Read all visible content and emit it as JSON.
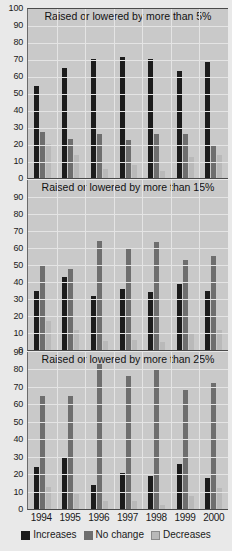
{
  "chart_data": {
    "type": "bar",
    "title": "",
    "xlabel": "",
    "ylabel": "",
    "grid": true,
    "legend_position": "bottom",
    "categories": [
      "1994",
      "1995",
      "1996",
      "1997",
      "1998",
      "1999",
      "2000"
    ],
    "legend": [
      "Increases",
      "No change",
      "Decreases"
    ],
    "colors": {
      "increases": "#1c1c1c",
      "no_change": "#6e6e6e",
      "decreases": "#b9b9b9",
      "plot_background": "#c9c9c9",
      "page_background": "#e9e9e9",
      "gridline": "#e4e4e4"
    },
    "panels": [
      {
        "title": "Raised or lowered by more than 5%",
        "ylim": [
          0,
          100
        ],
        "yticks": [
          0,
          10,
          20,
          30,
          40,
          50,
          60,
          70,
          80,
          90,
          100
        ],
        "series": [
          {
            "name": "Increases",
            "values": [
              54,
              65,
              70,
              71,
              70,
              63,
              68
            ]
          },
          {
            "name": "No change",
            "values": [
              27,
              23,
              26,
              22.5,
              26,
              26,
              19
            ]
          },
          {
            "name": "Decreases",
            "values": [
              20,
              13.5,
              5.5,
              7.5,
              4,
              12.5,
              13.5
            ]
          }
        ]
      },
      {
        "title": "Raised or lowered by more than 15%",
        "ylim": [
          0,
          100
        ],
        "yticks": [
          0,
          10,
          20,
          30,
          40,
          50,
          60,
          70,
          80,
          90
        ],
        "series": [
          {
            "name": "Increases",
            "values": [
              35,
              43,
              32,
              36,
              34,
              39,
              35
            ]
          },
          {
            "name": "No change",
            "values": [
              50,
              47.5,
              64,
              60,
              63.5,
              53,
              55.5
            ]
          },
          {
            "name": "Decreases",
            "values": [
              17,
              11.5,
              5.5,
              6,
              4.5,
              9.5,
              12
            ]
          }
        ]
      },
      {
        "title": "Raised or lowered by more than 25%",
        "ylim": [
          0,
          90
        ],
        "yticks": [
          0,
          10,
          20,
          30,
          40,
          50,
          60,
          70,
          80,
          90
        ],
        "series": [
          {
            "name": "Increases",
            "values": [
              24,
              29,
              14,
              20.5,
              19,
              26,
              18
            ]
          },
          {
            "name": "No change",
            "values": [
              65,
              64.5,
              83,
              76,
              80.5,
              68,
              72
            ]
          },
          {
            "name": "Decreases",
            "values": [
              12.5,
              8.5,
              4.5,
              4.5,
              2.5,
              7.5,
              12
            ]
          }
        ]
      }
    ]
  }
}
